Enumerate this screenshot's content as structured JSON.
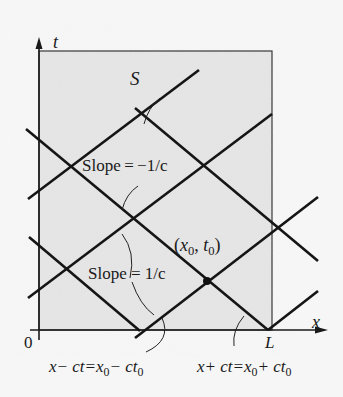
{
  "diagram": {
    "type": "characteristics diagram (x-t plane)",
    "axes": {
      "x_label": "x",
      "t_label": "t",
      "origin_label": "0",
      "L_label": "L"
    },
    "region_label": "S",
    "point_label": {
      "x": "x",
      "x_sub": "0",
      "t": "t",
      "t_sub": "0"
    },
    "slope_neg_label": "Slope = −1/c",
    "slope_pos_label": "Slope = 1/c",
    "eq_minus": {
      "lhs": "x− ct=x",
      "sub1": "0",
      "mid": "− ct",
      "sub2": "0"
    },
    "eq_plus": {
      "lhs": "x+ ct=x",
      "sub1": "0",
      "mid": "+ ct",
      "sub2": "0"
    },
    "colors": {
      "domain_fill": "#e4e4e4",
      "background": "#f6f6f6",
      "line": "#151515"
    }
  }
}
